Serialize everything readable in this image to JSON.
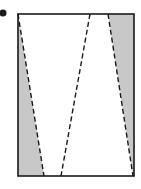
{
  "figure": {
    "colors": {
      "shade": "#c8c8c8",
      "stroke": "#1a1a1a",
      "background": "#ffffff"
    },
    "bullet": {
      "cx": 3,
      "cy": 13,
      "r": 3.5
    },
    "rectangle": {
      "x": 18,
      "y": 14,
      "width": 116,
      "height": 162
    },
    "dashed_lines": [
      {
        "x1": 18,
        "y1": 14,
        "x2": 44,
        "y2": 176
      },
      {
        "x1": 90,
        "y1": 14,
        "x2": 61,
        "y2": 176
      },
      {
        "x1": 108,
        "y1": 14,
        "x2": 133,
        "y2": 176
      }
    ],
    "shaded_regions": [
      {
        "points": "18,14 44,176 18,176"
      },
      {
        "points": "108,14 134,14 134,176 133,176"
      }
    ]
  }
}
